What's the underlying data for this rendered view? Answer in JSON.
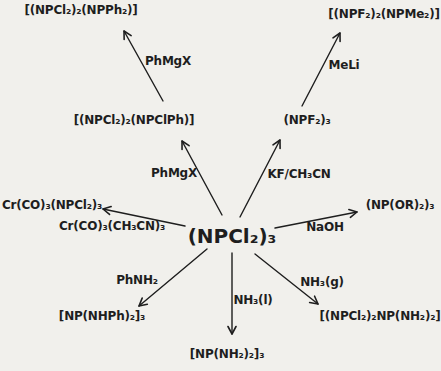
{
  "figure": {
    "background": "#f1f0ec",
    "ink": "#1e1e1e"
  },
  "center": {
    "id": "npcl2-3",
    "formula": "(NPCl₂)₃",
    "x": 232,
    "y": 236
  },
  "products": [
    {
      "id": "npcl2-2-npph2",
      "formula": "[(NPCl₂)₂(NPPh₂)]",
      "x": 81,
      "y": 11
    },
    {
      "id": "npf2-2-npme2",
      "formula": "[(NPF₂)₂(NPMe₂)]",
      "x": 384,
      "y": 15
    },
    {
      "id": "npcl2-2-npclph",
      "formula": "[(NPCl₂)₂(NPClPh)]",
      "x": 134,
      "y": 121
    },
    {
      "id": "npf2-3",
      "formula": "(NPF₂)₃",
      "x": 307,
      "y": 121
    },
    {
      "id": "cr-co-3-npcl2-3",
      "formula": "Cr(CO)₃(NPCl₂)₃",
      "x": 52,
      "y": 206
    },
    {
      "id": "np-or-2-3",
      "formula": "(NP(OR)₂)₃",
      "x": 400,
      "y": 206
    },
    {
      "id": "np-nhph-2-3",
      "formula": "[NP(NHPh)₂]₃",
      "x": 102,
      "y": 317
    },
    {
      "id": "np-nh2-2-3",
      "formula": "[NP(NH₂)₂]₃",
      "x": 227,
      "y": 355
    },
    {
      "id": "npcl2-2-np-nh2-2",
      "formula": "[(NPCl₂)₂NP(NH₂)₂]",
      "x": 380,
      "y": 317
    }
  ],
  "reagent_labels": [
    {
      "id": "phmgx-upper",
      "label": "PhMgX",
      "x": 168,
      "y": 62
    },
    {
      "id": "meli",
      "label": "MeLi",
      "x": 344,
      "y": 66
    },
    {
      "id": "phmgx-lower",
      "label": "PhMgX",
      "x": 174,
      "y": 174
    },
    {
      "id": "kf-ch3cn",
      "label": "KF/CH₃CN",
      "x": 299,
      "y": 175
    },
    {
      "id": "cr-co-3-ch3cn-3",
      "label": "Cr(CO)₃(CH₃CN)₃",
      "x": 112,
      "y": 227
    },
    {
      "id": "naoh",
      "label": "NaOH",
      "x": 325,
      "y": 228
    },
    {
      "id": "phnh2",
      "label": "PhNH₂",
      "x": 137,
      "y": 281
    },
    {
      "id": "nh3-l",
      "label": "NH₃(l)",
      "x": 253,
      "y": 301
    },
    {
      "id": "nh3-g",
      "label": "NH₃(g)",
      "x": 322,
      "y": 283
    }
  ],
  "arrows": [
    {
      "id": "npclph-to-npph2",
      "from": "npcl2-2-npclph",
      "to": "npcl2-2-npph2",
      "reagent": "PhMgX",
      "x1": 163,
      "y1": 101,
      "x2": 124,
      "y2": 31
    },
    {
      "id": "npf2-to-npme2",
      "from": "npf2-3",
      "to": "npf2-2-npme2",
      "reagent": "MeLi",
      "x1": 302,
      "y1": 106,
      "x2": 340,
      "y2": 33
    },
    {
      "id": "center-to-npclph",
      "from": "npcl2-3",
      "to": "npcl2-2-npclph",
      "reagent": "PhMgX",
      "x1": 222,
      "y1": 215,
      "x2": 182,
      "y2": 141
    },
    {
      "id": "center-to-npf2-3",
      "from": "npcl2-3",
      "to": "npf2-3",
      "reagent": "KF/CH₃CN",
      "x1": 240,
      "y1": 217,
      "x2": 280,
      "y2": 140
    },
    {
      "id": "center-to-cr",
      "from": "npcl2-3",
      "to": "cr-co-3-npcl2-3",
      "reagent": "Cr(CO)₃(CH₃CN)₃",
      "x1": 185,
      "y1": 226,
      "x2": 103,
      "y2": 209
    },
    {
      "id": "center-to-npor",
      "from": "npcl2-3",
      "to": "np-or-2-3",
      "reagent": "NaOH",
      "x1": 275,
      "y1": 228,
      "x2": 357,
      "y2": 212
    },
    {
      "id": "center-to-nhph",
      "from": "npcl2-3",
      "to": "np-nhph-2-3",
      "reagent": "PhNH₂",
      "x1": 207,
      "y1": 249,
      "x2": 139,
      "y2": 306
    },
    {
      "id": "center-to-nh2",
      "from": "npcl2-3",
      "to": "np-nh2-2-3",
      "reagent": "NH₃(l)",
      "x1": 232,
      "y1": 253,
      "x2": 232,
      "y2": 334
    },
    {
      "id": "center-to-mixed-nh2",
      "from": "npcl2-3",
      "to": "npcl2-2-np-nh2-2",
      "reagent": "NH₃(g)",
      "x1": 255,
      "y1": 254,
      "x2": 318,
      "y2": 304
    }
  ]
}
